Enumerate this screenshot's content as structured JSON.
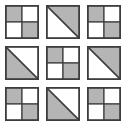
{
  "puzzle": {
    "rows": 3,
    "cols": 3,
    "tiles": [
      {
        "row": 1,
        "col": 1,
        "type": "checkerboard",
        "gray_quadrants": [
          "top-left",
          "bottom-right"
        ]
      },
      {
        "row": 1,
        "col": 2,
        "type": "diagonal",
        "gray_half": "upper-right"
      },
      {
        "row": 1,
        "col": 3,
        "type": "checkerboard",
        "gray_quadrants": [
          "top-left",
          "bottom-right"
        ]
      },
      {
        "row": 2,
        "col": 1,
        "type": "diagonal",
        "gray_half": "lower-left"
      },
      {
        "row": 2,
        "col": 2,
        "type": "checkerboard",
        "gray_quadrants": [
          "top-left",
          "bottom-right"
        ]
      },
      {
        "row": 2,
        "col": 3,
        "type": "diagonal",
        "gray_half": "upper-right"
      },
      {
        "row": 3,
        "col": 1,
        "type": "checkerboard",
        "gray_quadrants": [
          "top-left",
          "bottom-right"
        ]
      },
      {
        "row": 3,
        "col": 2,
        "type": "diagonal",
        "gray_half": "lower-left"
      },
      {
        "row": 3,
        "col": 3,
        "type": "checkerboard",
        "gray_quadrants": [
          "top-left",
          "bottom-right"
        ]
      }
    ],
    "colors": {
      "gray_fill": "#b5b5b5",
      "white_fill": "#ffffff",
      "line": "#3d3d3d",
      "background": "#ffffff"
    }
  }
}
